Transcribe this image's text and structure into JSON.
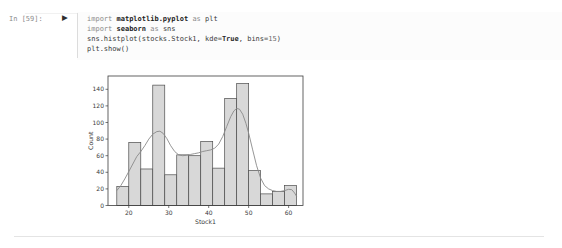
{
  "cell": {
    "prompt": "In [59]:",
    "run_icon": "▶",
    "code_lines": [
      [
        {
          "text": "import",
          "style": "kw"
        },
        {
          "text": " ",
          "style": "plain"
        },
        {
          "text": "matplotlib.pyplot",
          "style": "mod"
        },
        {
          "text": " ",
          "style": "plain"
        },
        {
          "text": "as",
          "style": "kw"
        },
        {
          "text": " plt",
          "style": "plain"
        }
      ],
      [
        {
          "text": "import",
          "style": "kw"
        },
        {
          "text": " ",
          "style": "plain"
        },
        {
          "text": "seaborn",
          "style": "mod"
        },
        {
          "text": " ",
          "style": "plain"
        },
        {
          "text": "as",
          "style": "kw"
        },
        {
          "text": " sns",
          "style": "plain"
        }
      ],
      [
        {
          "text": "sns.histplot(stocks.Stock1, kde",
          "style": "plain"
        },
        {
          "text": "=",
          "style": "op"
        },
        {
          "text": "True",
          "style": "builtin"
        },
        {
          "text": ", bins",
          "style": "plain"
        },
        {
          "text": "=",
          "style": "op"
        },
        {
          "text": "15",
          "style": "num"
        },
        {
          "text": ")",
          "style": "plain"
        }
      ],
      [
        {
          "text": "plt.show()",
          "style": "plain"
        }
      ]
    ]
  },
  "chart_data": {
    "type": "bar",
    "subtype": "histogram-with-kde",
    "title": "",
    "xlabel": "Stock1",
    "ylabel": "Count",
    "xlim": [
      14.8,
      63.6
    ],
    "ylim": [
      0,
      156
    ],
    "xticks": [
      20,
      30,
      40,
      50,
      60
    ],
    "yticks": [
      0,
      20,
      40,
      60,
      80,
      100,
      120,
      140
    ],
    "grid": false,
    "legend": "none",
    "bins": {
      "start": 17.0,
      "width": 3.0,
      "count": 15
    },
    "values": [
      23,
      76,
      44,
      145,
      37,
      61,
      60,
      77,
      45,
      129,
      147,
      42,
      14,
      17,
      24
    ],
    "kde_points": [
      [
        17,
        18
      ],
      [
        18,
        24
      ],
      [
        19,
        32
      ],
      [
        20,
        41
      ],
      [
        21,
        50
      ],
      [
        22,
        59
      ],
      [
        23,
        65
      ],
      [
        24,
        72
      ],
      [
        25,
        80
      ],
      [
        26,
        86
      ],
      [
        27,
        89
      ],
      [
        27.8,
        89.5
      ],
      [
        28.6,
        87
      ],
      [
        29.5,
        81
      ],
      [
        30.5,
        72
      ],
      [
        31.5,
        65
      ],
      [
        32.5,
        61
      ],
      [
        33.5,
        60
      ],
      [
        34.5,
        60.5
      ],
      [
        35.5,
        61.5
      ],
      [
        36.5,
        62.5
      ],
      [
        37.5,
        63.5
      ],
      [
        38.5,
        65
      ],
      [
        39.5,
        66
      ],
      [
        40.5,
        67
      ],
      [
        41.5,
        69
      ],
      [
        42.5,
        74
      ],
      [
        43.5,
        83
      ],
      [
        44.5,
        95
      ],
      [
        45.5,
        107
      ],
      [
        46.3,
        114
      ],
      [
        47,
        117
      ],
      [
        47.7,
        116
      ],
      [
        48.5,
        110
      ],
      [
        49.3,
        99
      ],
      [
        50,
        87
      ],
      [
        51,
        67
      ],
      [
        52,
        48
      ],
      [
        53,
        33
      ],
      [
        54,
        24
      ],
      [
        55,
        20
      ],
      [
        56,
        18
      ],
      [
        57,
        17
      ],
      [
        58,
        17
      ],
      [
        59,
        18
      ],
      [
        60,
        19.5
      ],
      [
        60.8,
        19
      ],
      [
        61.5,
        15
      ],
      [
        62,
        11
      ]
    ],
    "colors": {
      "bar_fill": "#d8d8d8",
      "bar_stroke": "#4c4c4c",
      "kde_line": "#8a8a8a",
      "axis": "#3c3c3c",
      "tick_text": "#3a3a3a"
    }
  }
}
